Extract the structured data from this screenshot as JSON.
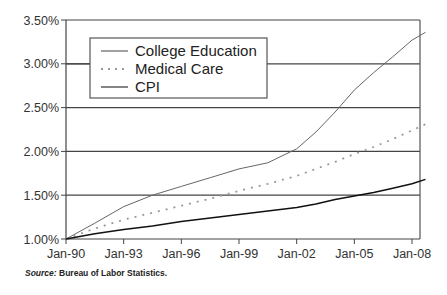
{
  "chart_data": {
    "type": "line",
    "title": "",
    "xlabel": "",
    "ylabel": "",
    "x_ticks": [
      "Jan-90",
      "Jan-93",
      "Jan-96",
      "Jan-99",
      "Jan-02",
      "Jan-05",
      "Jan-08"
    ],
    "y_ticks": [
      "1.00%",
      "1.50%",
      "2.00%",
      "2.50%",
      "3.00%",
      "3.50%"
    ],
    "ylim": [
      1.0,
      3.5
    ],
    "xlim": [
      1990.0,
      2008.7
    ],
    "grid": "horizontal",
    "legend_position": "upper-left (boxed)",
    "x": [
      1990.0,
      1991.5,
      1993.0,
      1994.5,
      1996.0,
      1997.5,
      1999.0,
      2000.5,
      2002.0,
      2003.0,
      2004.0,
      2005.0,
      2006.0,
      2007.0,
      2008.0,
      2008.7
    ],
    "series": [
      {
        "name": "College Education",
        "style": "solid-thin",
        "color": "#555555",
        "values": [
          1.0,
          1.18,
          1.37,
          1.5,
          1.6,
          1.7,
          1.8,
          1.87,
          2.03,
          2.22,
          2.45,
          2.7,
          2.9,
          3.08,
          3.27,
          3.36
        ]
      },
      {
        "name": "Medical Care",
        "style": "dotted",
        "color": "#888888",
        "values": [
          1.0,
          1.12,
          1.22,
          1.3,
          1.38,
          1.46,
          1.55,
          1.63,
          1.72,
          1.8,
          1.88,
          1.97,
          2.05,
          2.14,
          2.24,
          2.31
        ]
      },
      {
        "name": "CPI",
        "style": "solid-thick",
        "color": "#111111",
        "values": [
          1.0,
          1.06,
          1.11,
          1.15,
          1.2,
          1.24,
          1.28,
          1.32,
          1.36,
          1.4,
          1.45,
          1.49,
          1.53,
          1.58,
          1.63,
          1.68
        ]
      }
    ]
  },
  "legend": {
    "items": [
      {
        "label": "College Education"
      },
      {
        "label": "Medical Care"
      },
      {
        "label": "CPI"
      }
    ]
  },
  "footer": {
    "source_label": "Source:",
    "source_text": " Bureau of Labor Statistics."
  }
}
